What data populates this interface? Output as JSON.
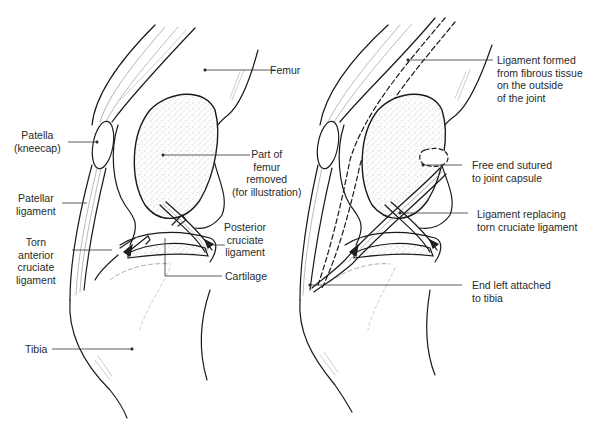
{
  "figure": {
    "left_panel": {
      "name": "knee-with-torn-acl",
      "labels": {
        "femur": "Femur",
        "patella": "Patella\n(kneecap)",
        "patellar_ligament": "Patellar\nligament",
        "torn_acl": "Torn\nanterior\ncruciate\nligament",
        "part_of_femur": "Part of\nfemur\nremoved\n(for illustration)",
        "posterior_cruciate": "Posterior\ncruciate\nligament",
        "cartilage": "Cartilage",
        "tibia": "Tibia"
      }
    },
    "right_panel": {
      "name": "knee-after-ligament-repair",
      "labels": {
        "ligament_formed": "Ligament formed\nfrom fibrous tissue\non the outside\nof the joint",
        "free_end": "Free end sutured\nto joint capsule",
        "ligament_replacing": "Ligament replacing\ntorn cruciate ligament",
        "end_attached": "End left attached\nto tibia"
      }
    },
    "colors": {
      "line": "#1a1a1a",
      "leader": "#333333",
      "stipple": "#8a8a8a",
      "background": "#ffffff"
    }
  }
}
